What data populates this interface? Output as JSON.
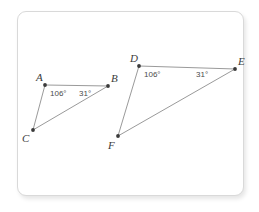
{
  "canvas": {
    "width": 259,
    "height": 212,
    "background": "#ffffff"
  },
  "card": {
    "border_color": "#d9d9d9",
    "fill": "#ffffff",
    "x": 17,
    "y": 11,
    "width": 227,
    "height": 185,
    "radius": 9
  },
  "style": {
    "segment_color": "#9a9a9a",
    "vertex_color": "#3a3a3a",
    "label_color": "#3b3b3b",
    "angle_color": "#4a4a4a",
    "segment_width": 1
  },
  "diagram": {
    "type": "similar-triangles",
    "triangles": [
      {
        "name": "triangle-abc",
        "vertices": [
          {
            "id": "A",
            "label": "A",
            "x": 45,
            "y": 85,
            "label_dx": -9,
            "label_dy": -13
          },
          {
            "id": "B",
            "label": "B",
            "x": 108,
            "y": 86,
            "label_dx": 3,
            "label_dy": -13
          },
          {
            "id": "C",
            "label": "C",
            "x": 33,
            "y": 130,
            "label_dx": -11,
            "label_dy": 3
          }
        ],
        "edges": [
          {
            "from": "A",
            "to": "B"
          },
          {
            "from": "A",
            "to": "C"
          },
          {
            "from": "C",
            "to": "B"
          }
        ],
        "angles": [
          {
            "at": "A",
            "label": "106°",
            "x": 50,
            "y": 90
          },
          {
            "at": "B",
            "label": "31°",
            "x": 79,
            "y": 90
          }
        ]
      },
      {
        "name": "triangle-def",
        "vertices": [
          {
            "id": "D",
            "label": "D",
            "x": 139,
            "y": 66,
            "label_dx": -9,
            "label_dy": -13
          },
          {
            "id": "E",
            "label": "E",
            "x": 235,
            "y": 69,
            "label_dx": 3,
            "label_dy": -13
          },
          {
            "id": "F",
            "label": "F",
            "x": 118,
            "y": 136,
            "label_dx": -10,
            "label_dy": 4
          }
        ],
        "edges": [
          {
            "from": "D",
            "to": "E"
          },
          {
            "from": "D",
            "to": "F"
          },
          {
            "from": "F",
            "to": "E"
          }
        ],
        "angles": [
          {
            "at": "D",
            "label": "106°",
            "x": 144,
            "y": 71
          },
          {
            "at": "E",
            "label": "31°",
            "x": 196,
            "y": 71
          }
        ]
      }
    ]
  }
}
